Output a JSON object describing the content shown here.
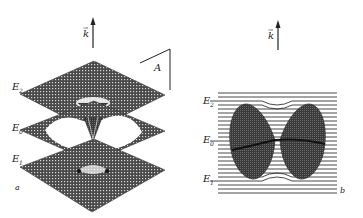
{
  "figure": {
    "panel_a": {
      "label": "a",
      "axis_label": "k",
      "axis_vector_mark": "→",
      "corner_label": "A",
      "levels": [
        {
          "name": "E",
          "sub": "2"
        },
        {
          "name": "E",
          "sub": "0"
        },
        {
          "name": "E",
          "sub": "1"
        }
      ]
    },
    "panel_b": {
      "label": "b",
      "axis_label": "k",
      "axis_vector_mark": "→",
      "levels": [
        {
          "name": "E",
          "sub": "2"
        },
        {
          "name": "E",
          "sub": "0"
        },
        {
          "name": "E",
          "sub": "1"
        }
      ]
    },
    "colors": {
      "ink": "#222222",
      "mesh": "#3a3a3a",
      "fill_dark": "#3c3c3c"
    }
  }
}
